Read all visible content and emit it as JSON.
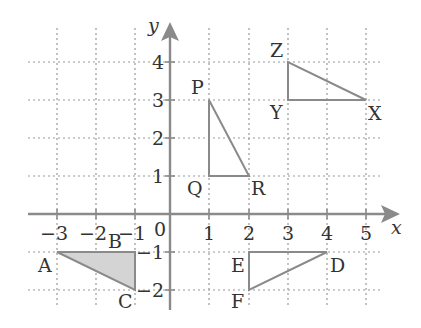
{
  "diagram": {
    "title": "",
    "axes": {
      "x_label": "x",
      "y_label": "y",
      "origin_label": "0",
      "x_ticks": [
        {
          "value": -3,
          "label": "−3"
        },
        {
          "value": -2,
          "label": "−2"
        },
        {
          "value": -1,
          "label": "−1"
        },
        {
          "value": 1,
          "label": "1"
        },
        {
          "value": 2,
          "label": "2"
        },
        {
          "value": 3,
          "label": "3"
        },
        {
          "value": 4,
          "label": "4"
        },
        {
          "value": 5,
          "label": "5"
        }
      ],
      "y_ticks": [
        {
          "value": 4,
          "label": "4"
        },
        {
          "value": 3,
          "label": "3"
        },
        {
          "value": 2,
          "label": "2"
        },
        {
          "value": 1,
          "label": "1"
        },
        {
          "value": -1,
          "label": "−1"
        },
        {
          "value": -2,
          "label": "−2"
        }
      ],
      "x_range": [
        -3,
        5
      ],
      "y_range": [
        -2,
        4
      ]
    },
    "colors": {
      "axis": "#8a8a8a",
      "grid": "#9a9a9a",
      "triangle_stroke": "#8a8a8a",
      "shaded_fill": "#d4d4d4",
      "text": "#333333"
    },
    "triangles": [
      {
        "name": "ABC",
        "shaded": true,
        "vertices": [
          {
            "label": "A",
            "x": -3,
            "y": -1
          },
          {
            "label": "B",
            "x": -1,
            "y": -1
          },
          {
            "label": "C",
            "x": -1,
            "y": -2
          }
        ]
      },
      {
        "name": "PQR",
        "shaded": false,
        "vertices": [
          {
            "label": "P",
            "x": 1,
            "y": 3
          },
          {
            "label": "Q",
            "x": 1,
            "y": 1
          },
          {
            "label": "R",
            "x": 2,
            "y": 1
          }
        ]
      },
      {
        "name": "XYZ",
        "shaded": false,
        "vertices": [
          {
            "label": "X",
            "x": 5,
            "y": 3
          },
          {
            "label": "Y",
            "x": 3,
            "y": 3
          },
          {
            "label": "Z",
            "x": 3,
            "y": 4
          }
        ]
      },
      {
        "name": "DEF",
        "shaded": false,
        "vertices": [
          {
            "label": "D",
            "x": 4,
            "y": -1
          },
          {
            "label": "E",
            "x": 2,
            "y": -1
          },
          {
            "label": "F",
            "x": 2,
            "y": -2
          }
        ]
      }
    ]
  }
}
